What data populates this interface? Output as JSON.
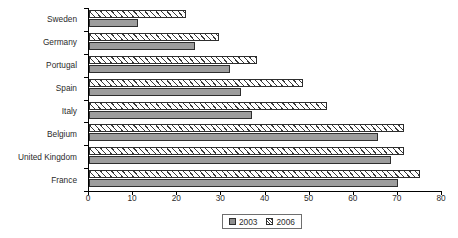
{
  "chart_data": {
    "type": "bar",
    "orientation": "horizontal",
    "title": "",
    "subtitle": "",
    "xlabel": "",
    "ylabel": "",
    "categories": [
      "Sweden",
      "Germany",
      "Portugal",
      "Spain",
      "Italy",
      "Belgium",
      "United Kingdom",
      "France"
    ],
    "series": [
      {
        "name": "2003",
        "values": [
          11,
          24,
          32,
          34.5,
          37,
          65.5,
          68.5,
          70
        ]
      },
      {
        "name": "2006",
        "values": [
          22,
          29.5,
          38,
          48.5,
          54,
          71.5,
          71.5,
          75
        ]
      }
    ],
    "xlim": [
      0,
      80
    ],
    "xticks": [
      0,
      10,
      20,
      30,
      40,
      50,
      60,
      70,
      80
    ],
    "xtick_labels": [
      "0",
      "10",
      "20",
      "30",
      "40",
      "50",
      "60",
      "70",
      "80"
    ],
    "grid": false,
    "legend_position": "bottom",
    "legend_entries": [
      "2003",
      "2006"
    ],
    "annotations": []
  },
  "legend": {
    "items": [
      {
        "label": "2003",
        "style": "solid-gray"
      },
      {
        "label": "2006",
        "style": "diagonal-hatch"
      }
    ]
  }
}
